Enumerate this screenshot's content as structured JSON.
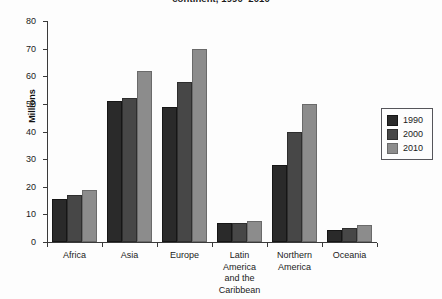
{
  "chart_data": {
    "type": "bar",
    "title": "continent, 1990–2010",
    "xlabel": "",
    "ylabel": "Millions",
    "ylim": [
      0,
      80
    ],
    "yticks": [
      0,
      10,
      20,
      30,
      40,
      50,
      60,
      70,
      80
    ],
    "grid": false,
    "legend_position": "right",
    "categories": [
      "Africa",
      "Asia",
      "Europe",
      "Latin America and the Caribbean",
      "Northern America",
      "Oceania"
    ],
    "category_labels": [
      [
        "Africa"
      ],
      [
        "Asia"
      ],
      [
        "Europe"
      ],
      [
        "Latin",
        "America",
        "and the",
        "Caribbean"
      ],
      [
        "Northern",
        "America"
      ],
      [
        "Oceania"
      ]
    ],
    "series": [
      {
        "name": "1990",
        "color": "#2a2a2a",
        "values": [
          15.5,
          51,
          49,
          7,
          28,
          4.5
        ]
      },
      {
        "name": "2000",
        "color": "#474747",
        "values": [
          17,
          52,
          58,
          7,
          40,
          5
        ]
      },
      {
        "name": "2010",
        "color": "#8c8c8c",
        "values": [
          19,
          62,
          70,
          7.5,
          50,
          6
        ]
      }
    ]
  }
}
